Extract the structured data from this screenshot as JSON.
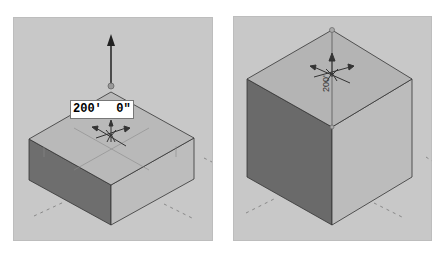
{
  "viewports": [
    {
      "name": "left",
      "description": "Box being extruded upward with push/pull arrow",
      "dimension_input": {
        "value": "200'  0\""
      },
      "colors": {
        "background": "#c8c8c8",
        "top_face": "#b9b9b9",
        "left_face": "#6e6e6e",
        "right_face": "#bdbdbd"
      }
    },
    {
      "name": "right",
      "description": "Resulting cube with vertical dimension",
      "dimension_label": {
        "value": "200'"
      },
      "colors": {
        "background": "#c8c8c8",
        "top_face": "#b4b4b4",
        "left_face": "#6a6a6a",
        "right_face": "#bcbcbc"
      }
    }
  ]
}
